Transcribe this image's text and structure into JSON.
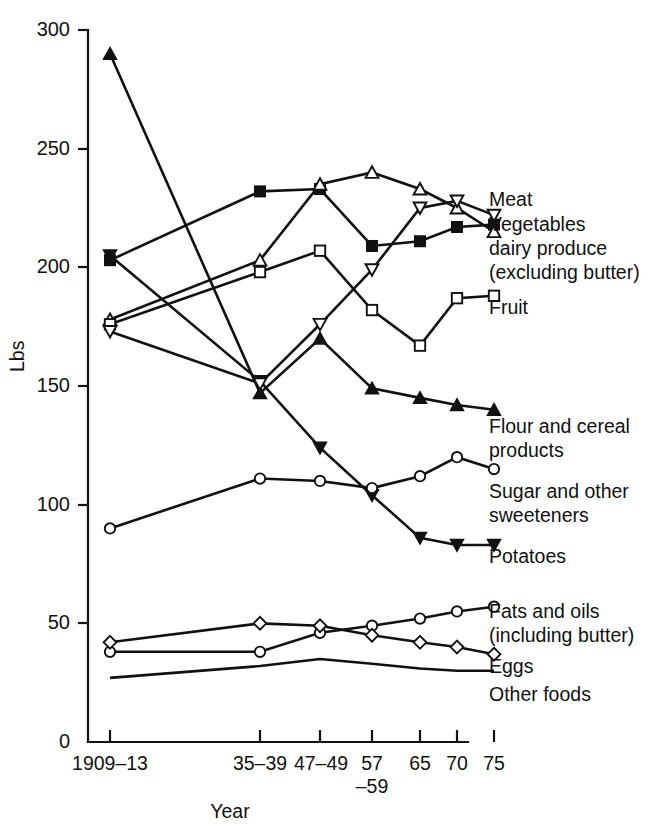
{
  "chart_data": {
    "type": "line",
    "title": "",
    "xlabel": "Year",
    "ylabel": "Lbs",
    "ylim": [
      0,
      300
    ],
    "yticks": [
      0,
      50,
      100,
      150,
      200,
      250,
      300
    ],
    "grid": false,
    "legend_position": "right-inline",
    "categories": [
      "1909-13",
      "35-39",
      "47-49",
      "57\n-59",
      "65",
      "70",
      "75"
    ],
    "x_positions": [
      110,
      260,
      320,
      372,
      420,
      457,
      494
    ],
    "series": [
      {
        "name": "Flour and cereal products",
        "marker": "filled-triangle-up",
        "values": [
          290,
          147,
          170,
          149,
          145,
          142,
          140
        ]
      },
      {
        "name": "Meat",
        "marker": "filled-square",
        "values": [
          203,
          232,
          233,
          209,
          211,
          217,
          218
        ]
      },
      {
        "name": "Vegetables dairy produce (excluding butter)",
        "marker": "open-triangle-up",
        "values": [
          178,
          203,
          235,
          240,
          233,
          225,
          215
        ]
      },
      {
        "name": "Potatoes",
        "marker": "filled-triangle-down",
        "values": [
          205,
          152,
          124,
          104,
          86,
          83,
          83
        ]
      },
      {
        "name": "Fruit",
        "marker": "open-square",
        "values": [
          176,
          198,
          207,
          182,
          167,
          187,
          188
        ]
      },
      {
        "name": "Sugar and other sweeteners",
        "marker": "open-circle",
        "values": [
          90,
          111,
          110,
          107,
          112,
          120,
          115
        ]
      },
      {
        "name": "Fats and oils (including butter)",
        "marker": "open-circle",
        "values": [
          38,
          38,
          46,
          49,
          52,
          55,
          57
        ]
      },
      {
        "name": "Eggs",
        "marker": "open-diamond",
        "values": [
          42,
          50,
          49,
          45,
          42,
          40,
          37
        ]
      },
      {
        "name": "Other foods",
        "marker": "none",
        "values": [
          27,
          32,
          35,
          33,
          31,
          30,
          30
        ]
      },
      {
        "name": "Vegetables-secondary",
        "marker": "open-triangle-down",
        "values": [
          173,
          151,
          176,
          199,
          225,
          228,
          222
        ]
      }
    ],
    "legend_entries": [
      {
        "label": "Meat"
      },
      {
        "label": "Vegetables\ndairy produce\n(excluding butter)"
      },
      {
        "label": "Fruit"
      },
      {
        "label": "Flour and cereal\nproducts"
      },
      {
        "label": "Sugar and other\nsweeteners"
      },
      {
        "label": "Potatoes"
      },
      {
        "label": "Fats and oils\n(including butter)"
      },
      {
        "label": "Eggs"
      },
      {
        "label": "Other foods"
      }
    ]
  },
  "yticks": {
    "t300": "300",
    "t250": "250",
    "t200": "200",
    "t150": "150",
    "t100": "100",
    "t50": "50",
    "t0": "0"
  },
  "xticks": {
    "x1": "1909–13",
    "x2": "35–39",
    "x3": "47–49",
    "x4": "57\n–59",
    "x5": "65",
    "x6": "70",
    "x7": "75"
  },
  "labels": {
    "y_axis_title": "Lbs",
    "x_axis_title": "Year"
  },
  "legend": {
    "meat": "Meat",
    "vegetables": "Vegetables\ndairy produce\n(excluding butter)",
    "fruit": "Fruit",
    "flour": "Flour and cereal\nproducts",
    "sugar": "Sugar and other\nsweeteners",
    "potatoes": "Potatoes",
    "fats": "Fats and oils\n(including butter)",
    "eggs": "Eggs",
    "other": "Other foods"
  }
}
